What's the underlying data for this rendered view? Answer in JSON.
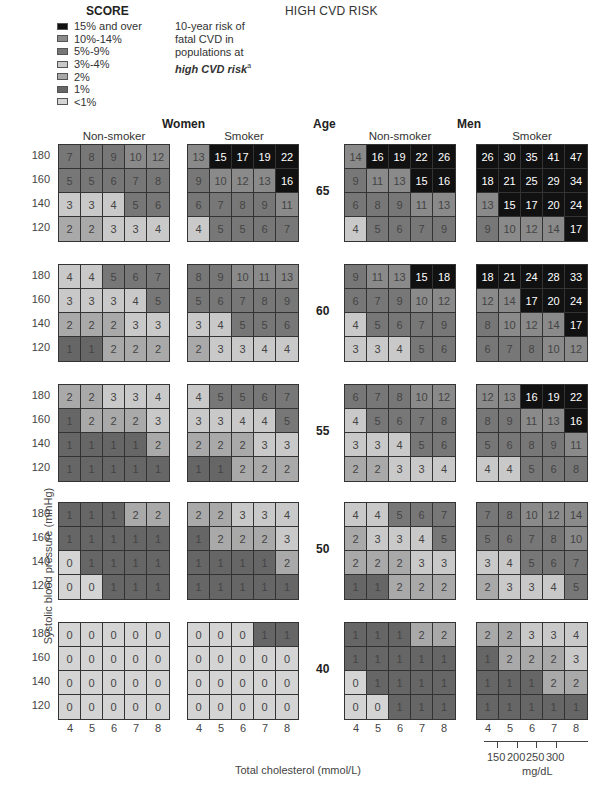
{
  "header": {
    "score_title": "SCORE",
    "title": "HIGH CVD RISK",
    "description_lines": [
      "10-year risk of",
      "fatal CVD in",
      "populations at"
    ],
    "description_emph": "high CVD risk",
    "description_sup": "a"
  },
  "legend": [
    {
      "label": "15% and over",
      "color": "#111111"
    },
    {
      "label": "10%-14%",
      "color": "#8a8a8a"
    },
    {
      "label": "5%-9%",
      "color": "#777777"
    },
    {
      "label": "3%-4%",
      "color": "#c9c9c9"
    },
    {
      "label": "2%",
      "color": "#a9a9a9"
    },
    {
      "label": "1%",
      "color": "#666666"
    },
    {
      "label": "<1%",
      "color": "#d4d4d4"
    }
  ],
  "labels": {
    "women": "Women",
    "men": "Men",
    "age": "Age",
    "non_smoker": "Non-smoker",
    "smoker": "Smoker",
    "y_axis": "Systolic blood pressure (mmHg)",
    "x_axis": "Total cholesterol (mmol/L)",
    "mg_unit": "mg/dL"
  },
  "sbp_ticks": [
    "180",
    "160",
    "140",
    "120"
  ],
  "chol_ticks": [
    "4",
    "5",
    "6",
    "7",
    "8"
  ],
  "mg_ticks": [
    "150",
    "200",
    "250",
    "300"
  ],
  "chart_data": {
    "type": "heatmap",
    "xlabel": "Total cholesterol (mmol/L)",
    "ylabel": "Systolic blood pressure (mmHg)",
    "x": [
      4,
      5,
      6,
      7,
      8
    ],
    "y": [
      180,
      160,
      140,
      120
    ],
    "ages": [
      65,
      60,
      55,
      50,
      40
    ],
    "panels": {
      "women_nonsmoker": {
        "65": [
          [
            7,
            8,
            9,
            10,
            12
          ],
          [
            5,
            5,
            6,
            7,
            8
          ],
          [
            3,
            3,
            4,
            5,
            6
          ],
          [
            2,
            2,
            3,
            3,
            4
          ]
        ],
        "60": [
          [
            4,
            4,
            5,
            6,
            7
          ],
          [
            3,
            3,
            3,
            4,
            5
          ],
          [
            2,
            2,
            2,
            3,
            3
          ],
          [
            1,
            1,
            2,
            2,
            2
          ]
        ],
        "55": [
          [
            2,
            2,
            3,
            3,
            4
          ],
          [
            1,
            2,
            2,
            2,
            3
          ],
          [
            1,
            1,
            1,
            1,
            2
          ],
          [
            1,
            1,
            1,
            1,
            1
          ]
        ],
        "50": [
          [
            1,
            1,
            1,
            2,
            2
          ],
          [
            1,
            1,
            1,
            1,
            1
          ],
          [
            0,
            1,
            1,
            1,
            1
          ],
          [
            0,
            0,
            1,
            1,
            1
          ]
        ],
        "40": [
          [
            0,
            0,
            0,
            0,
            0
          ],
          [
            0,
            0,
            0,
            0,
            0
          ],
          [
            0,
            0,
            0,
            0,
            0
          ],
          [
            0,
            0,
            0,
            0,
            0
          ]
        ]
      },
      "women_smoker": {
        "65": [
          [
            13,
            15,
            17,
            19,
            22
          ],
          [
            9,
            10,
            12,
            13,
            16
          ],
          [
            6,
            7,
            8,
            9,
            11
          ],
          [
            4,
            5,
            5,
            6,
            7
          ]
        ],
        "60": [
          [
            8,
            9,
            10,
            11,
            13
          ],
          [
            5,
            6,
            7,
            8,
            9
          ],
          [
            3,
            4,
            5,
            5,
            6
          ],
          [
            2,
            3,
            3,
            4,
            4
          ]
        ],
        "55": [
          [
            4,
            5,
            5,
            6,
            7
          ],
          [
            3,
            3,
            4,
            4,
            5
          ],
          [
            2,
            2,
            2,
            3,
            3
          ],
          [
            1,
            1,
            2,
            2,
            2
          ]
        ],
        "50": [
          [
            2,
            2,
            3,
            3,
            4
          ],
          [
            1,
            2,
            2,
            2,
            3
          ],
          [
            1,
            1,
            1,
            1,
            2
          ],
          [
            1,
            1,
            1,
            1,
            1
          ]
        ],
        "40": [
          [
            0,
            0,
            0,
            1,
            1
          ],
          [
            0,
            0,
            0,
            0,
            0
          ],
          [
            0,
            0,
            0,
            0,
            0
          ],
          [
            0,
            0,
            0,
            0,
            0
          ]
        ]
      },
      "men_nonsmoker": {
        "65": [
          [
            14,
            16,
            19,
            22,
            26
          ],
          [
            9,
            11,
            13,
            15,
            16
          ],
          [
            6,
            8,
            9,
            11,
            13
          ],
          [
            4,
            5,
            6,
            7,
            9
          ]
        ],
        "60": [
          [
            9,
            11,
            13,
            15,
            18
          ],
          [
            6,
            7,
            9,
            10,
            12
          ],
          [
            4,
            5,
            6,
            7,
            9
          ],
          [
            3,
            3,
            4,
            5,
            6
          ]
        ],
        "55": [
          [
            6,
            7,
            8,
            10,
            12
          ],
          [
            4,
            5,
            6,
            7,
            8
          ],
          [
            3,
            3,
            4,
            5,
            6
          ],
          [
            2,
            2,
            3,
            3,
            4
          ]
        ],
        "50": [
          [
            4,
            4,
            5,
            6,
            7
          ],
          [
            2,
            3,
            3,
            4,
            5
          ],
          [
            2,
            2,
            2,
            3,
            3
          ],
          [
            1,
            1,
            2,
            2,
            2
          ]
        ],
        "40": [
          [
            1,
            1,
            1,
            2,
            2
          ],
          [
            1,
            1,
            1,
            1,
            1
          ],
          [
            0,
            1,
            1,
            1,
            1
          ],
          [
            0,
            0,
            1,
            1,
            1
          ]
        ]
      },
      "men_smoker": {
        "65": [
          [
            26,
            30,
            35,
            41,
            47
          ],
          [
            18,
            21,
            25,
            29,
            34
          ],
          [
            13,
            15,
            17,
            20,
            24
          ],
          [
            9,
            10,
            12,
            14,
            17
          ]
        ],
        "60": [
          [
            18,
            21,
            24,
            28,
            33
          ],
          [
            12,
            14,
            17,
            20,
            24
          ],
          [
            8,
            10,
            12,
            14,
            17
          ],
          [
            6,
            7,
            8,
            10,
            12
          ]
        ],
        "55": [
          [
            12,
            13,
            16,
            19,
            22
          ],
          [
            8,
            9,
            11,
            13,
            16
          ],
          [
            5,
            6,
            8,
            9,
            11
          ],
          [
            4,
            4,
            5,
            6,
            8
          ]
        ],
        "50": [
          [
            7,
            8,
            10,
            12,
            14
          ],
          [
            5,
            6,
            7,
            8,
            10
          ],
          [
            3,
            4,
            5,
            6,
            7
          ],
          [
            2,
            3,
            3,
            4,
            5
          ]
        ],
        "40": [
          [
            2,
            2,
            3,
            3,
            4
          ],
          [
            1,
            2,
            2,
            2,
            3
          ],
          [
            1,
            1,
            1,
            2,
            2
          ],
          [
            1,
            1,
            1,
            1,
            1
          ]
        ]
      }
    },
    "color_bins": [
      {
        "range": ">=15",
        "color": "#111111"
      },
      {
        "range": "10-14",
        "color": "#8a8a8a"
      },
      {
        "range": "5-9",
        "color": "#777777"
      },
      {
        "range": "3-4",
        "color": "#c9c9c9"
      },
      {
        "range": "2",
        "color": "#a9a9a9"
      },
      {
        "range": "1",
        "color": "#666666"
      },
      {
        "range": "<1",
        "color": "#d4d4d4"
      }
    ]
  }
}
